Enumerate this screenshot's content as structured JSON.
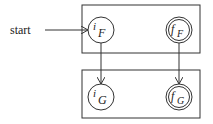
{
  "diagram": {
    "start_label": "start",
    "boxes": [
      {
        "id": "F",
        "x": 82,
        "y": 5,
        "w": 118,
        "h": 48
      },
      {
        "id": "G",
        "x": 82,
        "y": 70,
        "w": 118,
        "h": 48
      }
    ],
    "states": [
      {
        "id": "iF",
        "main": "i",
        "sub": "F",
        "cx": 101,
        "cy": 30,
        "accepting": false
      },
      {
        "id": "fF",
        "main": "f",
        "sub": "F",
        "cx": 179,
        "cy": 30,
        "accepting": true
      },
      {
        "id": "iG",
        "main": "i",
        "sub": "G",
        "cx": 101,
        "cy": 97,
        "accepting": false
      },
      {
        "id": "fG",
        "main": "f",
        "sub": "G",
        "cx": 179,
        "cy": 97,
        "accepting": true
      }
    ],
    "edges": [
      {
        "from": "start",
        "to": "iF"
      },
      {
        "from": "iF",
        "to": "iG"
      },
      {
        "from": "fF",
        "to": "fG"
      }
    ],
    "colors": {
      "stroke": "#333333",
      "background": "#ffffff"
    }
  }
}
